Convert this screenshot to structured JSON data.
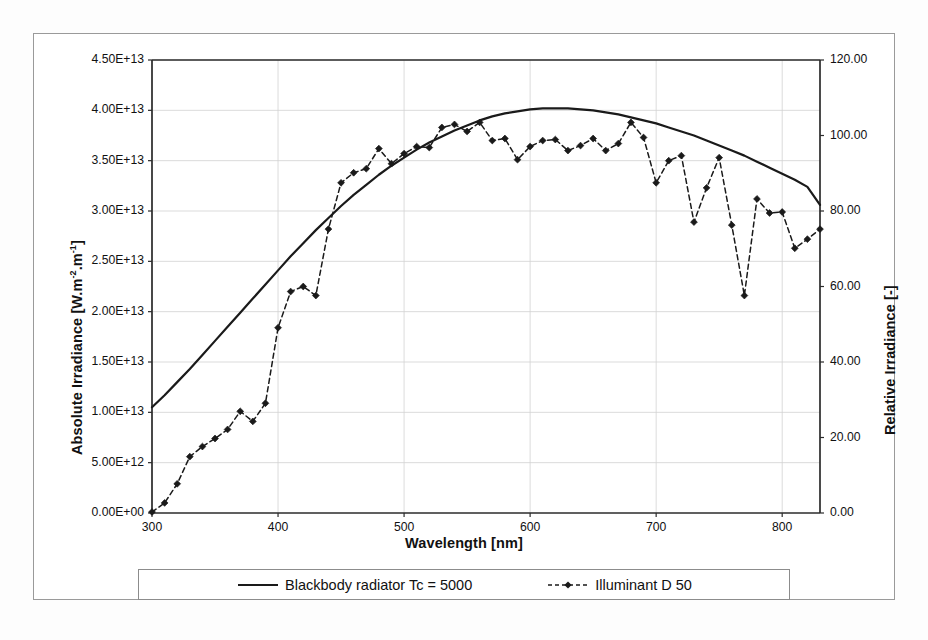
{
  "chart_data": {
    "type": "line",
    "title": "",
    "xlabel": "Wavelength [nm]",
    "ylabel": "Absolute Irradiance [W.m-2.m-1]",
    "ylabel_right": "Relative Irradiance [-]",
    "xlim": [
      300,
      830
    ],
    "ylim": [
      0,
      45000000000000.0
    ],
    "ylim_right": [
      0,
      120
    ],
    "grid": true,
    "legend_position": "bottom",
    "xticks": [
      300,
      400,
      500,
      600,
      700,
      800
    ],
    "xtick_labels": [
      "300",
      "400",
      "500",
      "600",
      "700",
      "800"
    ],
    "yticks_left": [
      0,
      5000000000000.0,
      10000000000000.0,
      15000000000000.0,
      20000000000000.0,
      25000000000000.0,
      30000000000000.0,
      35000000000000.0,
      40000000000000.0,
      45000000000000.0
    ],
    "ytick_labels_left": [
      "0.00E+00",
      "5.00E+12",
      "1.00E+13",
      "1.50E+13",
      "2.00E+13",
      "2.50E+13",
      "3.00E+13",
      "3.50E+13",
      "4.00E+13",
      "4.50E+13"
    ],
    "yticks_right": [
      0,
      20,
      40,
      60,
      80,
      100,
      120
    ],
    "ytick_labels_right": [
      "0.00",
      "20.00",
      "40.00",
      "60.00",
      "80.00",
      "100.00",
      "120.00"
    ],
    "series": [
      {
        "name": "Blackbody radiator Tc = 5000",
        "style": "solid",
        "marker": "none",
        "color": "#1a1a1a",
        "x": [
          300,
          310,
          320,
          330,
          340,
          350,
          360,
          370,
          380,
          390,
          400,
          410,
          420,
          430,
          440,
          450,
          460,
          470,
          480,
          490,
          500,
          510,
          520,
          530,
          540,
          550,
          560,
          570,
          580,
          590,
          600,
          610,
          620,
          630,
          640,
          650,
          660,
          670,
          680,
          690,
          700,
          710,
          720,
          730,
          740,
          750,
          760,
          770,
          780,
          790,
          800,
          810,
          820,
          830
        ],
        "values": [
          10500000000000.0,
          11700000000000.0,
          13000000000000.0,
          14300000000000.0,
          15700000000000.0,
          17100000000000.0,
          18500000000000.0,
          19900000000000.0,
          21300000000000.0,
          22700000000000.0,
          24100000000000.0,
          25500000000000.0,
          26800000000000.0,
          28100000000000.0,
          29300000000000.0,
          30500000000000.0,
          31600000000000.0,
          32600000000000.0,
          33600000000000.0,
          34500000000000.0,
          35300000000000.0,
          36100000000000.0,
          36800000000000.0,
          37400000000000.0,
          38000000000000.0,
          38500000000000.0,
          39000000000000.0,
          39400000000000.0,
          39700000000000.0,
          39900000000000.0,
          40100000000000.0,
          40200000000000.0,
          40200000000000.0,
          40200000000000.0,
          40100000000000.0,
          40000000000000.0,
          39800000000000.0,
          39600000000000.0,
          39300000000000.0,
          39000000000000.0,
          38700000000000.0,
          38300000000000.0,
          37900000000000.0,
          37500000000000.0,
          37000000000000.0,
          36500000000000.0,
          36000000000000.0,
          35500000000000.0,
          34900000000000.0,
          34300000000000.0,
          33700000000000.0,
          33100000000000.0,
          32400000000000.0,
          30600000000000.0
        ]
      },
      {
        "name": "Illuminant D 50",
        "style": "dashed",
        "marker": "diamond",
        "color": "#1a1a1a",
        "x": [
          300,
          310,
          320,
          330,
          340,
          350,
          360,
          370,
          380,
          390,
          400,
          410,
          420,
          430,
          440,
          450,
          460,
          470,
          480,
          490,
          500,
          510,
          520,
          530,
          540,
          550,
          560,
          570,
          580,
          590,
          600,
          610,
          620,
          630,
          640,
          650,
          660,
          670,
          680,
          690,
          700,
          710,
          720,
          730,
          740,
          750,
          760,
          770,
          780,
          790,
          800,
          810,
          820,
          830
        ],
        "values": [
          100000000000.0,
          1000000000000.0,
          2900000000000.0,
          5600000000000.0,
          6600000000000.0,
          7400000000000.0,
          8300000000000.0,
          10100000000000.0,
          9100000000000.0,
          10900000000000.0,
          18400000000000.0,
          22000000000000.0,
          22500000000000.0,
          21600000000000.0,
          28200000000000.0,
          32800000000000.0,
          33800000000000.0,
          34200000000000.0,
          36200000000000.0,
          34700000000000.0,
          35700000000000.0,
          36400000000000.0,
          36300000000000.0,
          38300000000000.0,
          38600000000000.0,
          37900000000000.0,
          38800000000000.0,
          37000000000000.0,
          37200000000000.0,
          35100000000000.0,
          36400000000000.0,
          37000000000000.0,
          37100000000000.0,
          36000000000000.0,
          36500000000000.0,
          37200000000000.0,
          36000000000000.0,
          36700000000000.0,
          38800000000000.0,
          37300000000000.0,
          32800000000000.0,
          35000000000000.0,
          35500000000000.0,
          28900000000000.0,
          32300000000000.0,
          35300000000000.0,
          28600000000000.0,
          21600000000000.0,
          31200000000000.0,
          29800000000000.0,
          29900000000000.0,
          26300000000000.0,
          27200000000000.0,
          28200000000000.0
        ]
      }
    ]
  },
  "axes": {
    "x_title": "Wavelength [nm]",
    "y_left_title_main": "Absolute Irradiance [W.m",
    "y_left_title_sup1": "-2",
    "y_left_title_mid": ".m",
    "y_left_title_sup2": "-1",
    "y_left_title_end": "]",
    "y_right_title": "Relative Irradiance [-]"
  },
  "legend": {
    "items": [
      {
        "label": "Blackbody radiator Tc = 5000",
        "key": "solid-line-key"
      },
      {
        "label": "Illuminant D 50",
        "key": "dashed-diamond-key"
      }
    ]
  }
}
